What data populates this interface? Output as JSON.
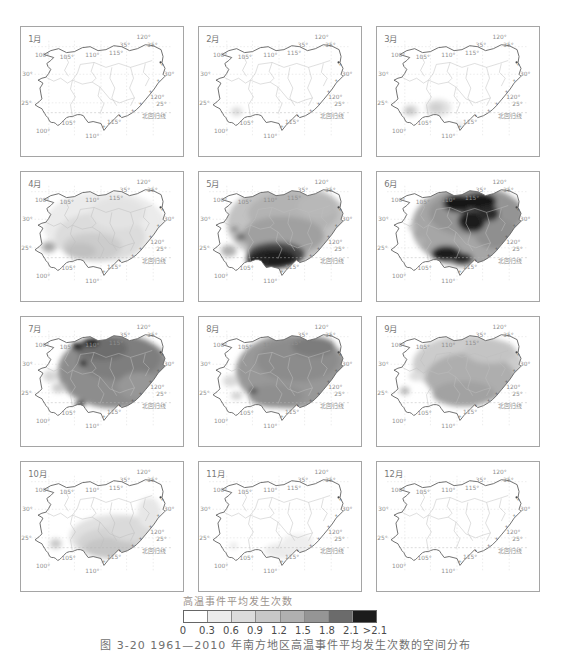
{
  "legend": {
    "title": "高温事件平均发生次数",
    "bins": [
      "0",
      "0.3",
      "0.6",
      "0.9",
      "1.2",
      "1.5",
      "1.8",
      "2.1",
      ">2.1"
    ],
    "colors": [
      "#ffffff",
      "#ececec",
      "#dbdbdb",
      "#c7c7c7",
      "#b0b0b0",
      "#959595",
      "#6b6b6b",
      "#1c1c1c"
    ]
  },
  "caption": "图 3-20 1961—2010 年南方地区高温事件平均发生次数的空间分布",
  "map_labels": [
    {
      "t": "100°",
      "x": 14,
      "y": 30
    },
    {
      "t": "105°",
      "x": 39,
      "y": 32
    },
    {
      "t": "110°",
      "x": 65,
      "y": 30
    },
    {
      "t": "115°",
      "x": 89,
      "y": 28
    },
    {
      "t": "120°",
      "x": 117,
      "y": 12
    },
    {
      "t": "35°",
      "x": 100,
      "y": 20
    },
    {
      "t": "35°",
      "x": 128,
      "y": 20
    },
    {
      "t": "30°",
      "x": 1,
      "y": 50
    },
    {
      "t": "30°",
      "x": 145,
      "y": 50
    },
    {
      "t": "25°",
      "x": 0,
      "y": 79
    },
    {
      "t": "120°",
      "x": 131,
      "y": 73
    },
    {
      "t": "25°",
      "x": 137,
      "y": 80
    },
    {
      "t": "北回归线",
      "x": 123,
      "y": 92
    },
    {
      "t": "105°",
      "x": 41,
      "y": 100
    },
    {
      "t": "115°",
      "x": 87,
      "y": 98
    },
    {
      "t": "100°",
      "x": 15,
      "y": 108
    },
    {
      "t": "110°",
      "x": 65,
      "y": 113
    }
  ],
  "panels": [
    {
      "label": "1月",
      "blobs": []
    },
    {
      "label": "2月",
      "blobs": [
        [
          38,
          86,
          6,
          5,
          "#e3e3e3"
        ],
        [
          38,
          86,
          3,
          2,
          "#cfcfcf"
        ]
      ]
    },
    {
      "label": "3月",
      "blobs": [
        [
          34,
          85,
          8,
          6,
          "#dcdcdc"
        ],
        [
          33,
          85,
          4,
          3,
          "#bfbfbf"
        ],
        [
          62,
          82,
          13,
          9,
          "#e2e2e2"
        ],
        [
          60,
          82,
          7,
          5,
          "#cfcfcf"
        ],
        [
          84,
          100,
          3,
          3,
          "#dddddd"
        ]
      ]
    },
    {
      "label": "4月",
      "blobs": [
        [
          85,
          55,
          62,
          36,
          "#ebebeb"
        ],
        [
          80,
          66,
          46,
          25,
          "#dcdcdc"
        ],
        [
          72,
          76,
          30,
          14,
          "#cccccc"
        ],
        [
          60,
          80,
          16,
          8,
          "#c0c0c0"
        ],
        [
          98,
          42,
          28,
          16,
          "#e3e3e3"
        ],
        [
          28,
          76,
          8,
          6,
          "#b8b8b8"
        ],
        [
          28,
          76,
          3,
          3,
          "#999999"
        ]
      ]
    },
    {
      "label": "5月",
      "blobs": [
        [
          90,
          52,
          62,
          40,
          "#c2c2c2"
        ],
        [
          95,
          42,
          46,
          22,
          "#b3b3b3"
        ],
        [
          85,
          65,
          42,
          20,
          "#a0a0a0"
        ],
        [
          120,
          35,
          20,
          12,
          "#b8b8b8"
        ],
        [
          78,
          84,
          30,
          13,
          "#4a4a4a"
        ],
        [
          75,
          88,
          24,
          10,
          "#1a1a1a"
        ],
        [
          60,
          90,
          12,
          7,
          "#222222"
        ],
        [
          42,
          66,
          5,
          4,
          "#6e6e6e"
        ],
        [
          36,
          58,
          4,
          3,
          "#8a8a8a"
        ],
        [
          30,
          80,
          8,
          6,
          "#b0b0b0"
        ]
      ]
    },
    {
      "label": "6月",
      "blobs": [
        [
          95,
          55,
          60,
          42,
          "#a6a6a6"
        ],
        [
          100,
          42,
          48,
          24,
          "#949494"
        ],
        [
          120,
          62,
          22,
          16,
          "#8f8f8f"
        ],
        [
          82,
          32,
          15,
          9,
          "#181818"
        ],
        [
          104,
          30,
          17,
          9,
          "#181818"
        ],
        [
          96,
          50,
          14,
          11,
          "#1d1d1d"
        ],
        [
          113,
          42,
          11,
          8,
          "#2a2a2a"
        ],
        [
          70,
          83,
          15,
          8,
          "#1a1a1a"
        ],
        [
          86,
          88,
          11,
          6,
          "#262626"
        ],
        [
          36,
          56,
          4,
          3,
          "#bdbdbd"
        ],
        [
          44,
          70,
          5,
          4,
          "#b0b0b0"
        ]
      ]
    },
    {
      "label": "7月",
      "blobs": [
        [
          95,
          55,
          58,
          38,
          "#8d8d8d"
        ],
        [
          100,
          42,
          42,
          22,
          "#7e7e7e"
        ],
        [
          82,
          32,
          26,
          12,
          "#6d6d6d"
        ],
        [
          120,
          70,
          22,
          14,
          "#979797"
        ],
        [
          57,
          30,
          6,
          4,
          "#141414"
        ],
        [
          71,
          26,
          8,
          4,
          "#141414"
        ],
        [
          63,
          47,
          4,
          3,
          "#202020"
        ],
        [
          60,
          88,
          5,
          3,
          "#333333"
        ],
        [
          30,
          60,
          8,
          6,
          "#d6d6d6"
        ],
        [
          38,
          72,
          7,
          5,
          "#cccccc"
        ]
      ]
    },
    {
      "label": "8月",
      "blobs": [
        [
          95,
          55,
          58,
          38,
          "#989898"
        ],
        [
          100,
          44,
          42,
          22,
          "#8c8c8c"
        ],
        [
          116,
          30,
          22,
          10,
          "#7b7b7b"
        ],
        [
          78,
          80,
          28,
          12,
          "#8f8f8f"
        ],
        [
          55,
          75,
          4,
          3,
          "#484848"
        ],
        [
          32,
          65,
          8,
          6,
          "#dadada"
        ],
        [
          38,
          80,
          6,
          4,
          "#d0d0d0"
        ]
      ]
    },
    {
      "label": "9月",
      "blobs": [
        [
          92,
          48,
          56,
          30,
          "#cccccc"
        ],
        [
          95,
          62,
          46,
          26,
          "#aeaeae"
        ],
        [
          88,
          78,
          32,
          13,
          "#a2a2a2"
        ],
        [
          115,
          35,
          26,
          12,
          "#c4c4c4"
        ],
        [
          28,
          75,
          5,
          4,
          "#b6b6b6"
        ],
        [
          40,
          60,
          8,
          5,
          "#dddddd"
        ]
      ]
    },
    {
      "label": "10月",
      "blobs": [
        [
          97,
          76,
          48,
          23,
          "#e1e1e1"
        ],
        [
          95,
          82,
          38,
          16,
          "#d3d3d3"
        ],
        [
          90,
          87,
          26,
          10,
          "#c6c6c6"
        ],
        [
          110,
          68,
          22,
          13,
          "#dadada"
        ],
        [
          130,
          52,
          12,
          16,
          "#e7e7e7"
        ],
        [
          35,
          83,
          6,
          5,
          "#c9c9c9"
        ]
      ]
    },
    {
      "label": "11月",
      "blobs": [
        [
          88,
          90,
          22,
          8,
          "#ebebeb"
        ],
        [
          100,
          82,
          16,
          9,
          "#eeeeee"
        ],
        [
          35,
          85,
          4,
          3,
          "#e7e7e7"
        ]
      ]
    },
    {
      "label": "12月",
      "blobs": []
    }
  ],
  "chart_data": {
    "type": "heatmap",
    "title": "高温事件平均发生次数",
    "legend_bins": [
      0,
      0.3,
      0.6,
      0.9,
      1.2,
      1.5,
      1.8,
      2.1
    ],
    "legend_open_end": ">2.1",
    "panel_layout": "3列×4行，1月—12月逐月地图",
    "map_extent": {
      "lon": [
        "100°",
        "120°"
      ],
      "lat": [
        "25°",
        "35°"
      ],
      "reference_line": "北回归线"
    },
    "months": [
      {
        "month": "1月",
        "approx_range": [
          0,
          0.3
        ],
        "note": "全域接近0"
      },
      {
        "month": "2月",
        "approx_range": [
          0,
          0.6
        ],
        "note": "滇西南小范围0.3—0.6"
      },
      {
        "month": "3月",
        "approx_range": [
          0,
          0.9
        ],
        "note": "滇南、桂西局部0.3—0.9"
      },
      {
        "month": "4月",
        "approx_range": [
          0.3,
          1.2
        ],
        "note": "中南部大范围0.3—0.9，西部局部偏高"
      },
      {
        "month": "5月",
        "approx_range": [
          0.9,
          2.1
        ],
        "note": "桂南—粤西出现>2.1高值区"
      },
      {
        "month": "6月",
        "approx_range": [
          1.2,
          2.1
        ],
        "note": "中东部多处>2.1高值区，西部接近0"
      },
      {
        "month": "7月",
        "approx_range": [
          1.2,
          1.8
        ],
        "note": "川东局部>2.1，西部接近0"
      },
      {
        "month": "8月",
        "approx_range": [
          1.2,
          1.8
        ],
        "note": "中东部大范围1.2—1.8，西部接近0"
      },
      {
        "month": "9月",
        "approx_range": [
          0.6,
          1.5
        ],
        "note": "中南部1.2左右，北部偏低"
      },
      {
        "month": "10月",
        "approx_range": [
          0.3,
          0.9
        ],
        "note": "南部及东南沿海0.3—0.9"
      },
      {
        "month": "11月",
        "approx_range": [
          0,
          0.3
        ],
        "note": "南部沿海局部略高"
      },
      {
        "month": "12月",
        "approx_range": [
          0,
          0.3
        ],
        "note": "全域接近0"
      }
    ]
  }
}
